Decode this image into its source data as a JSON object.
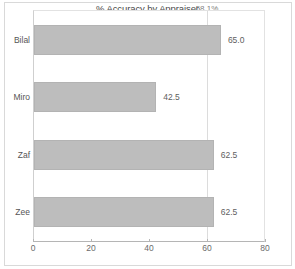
{
  "chart_data": {
    "type": "bar",
    "orientation": "horizontal",
    "title": "% Accuracy by Appraiser",
    "xlabel": "",
    "ylabel": "",
    "categories": [
      "Bilal",
      "Miro",
      "Zaf",
      "Zee"
    ],
    "values": [
      65.0,
      42.5,
      62.5,
      62.5
    ],
    "value_labels": [
      "65.0",
      "42.5",
      "62.5",
      "62.5"
    ],
    "xlim": [
      0,
      80
    ],
    "xticks": [
      0,
      20,
      40,
      60,
      80
    ],
    "xtick_labels": [
      "0",
      "20",
      "40",
      "60",
      "80"
    ],
    "grid": true,
    "gridlines_x": [
      60
    ],
    "legend": null,
    "annotations": [
      {
        "text": "58.1%",
        "x": 60,
        "position": "top",
        "role": "reference-line-label"
      }
    ],
    "colors": {
      "bar_fill": "#bdbdbd",
      "bar_edge": "#b3b3b3",
      "gridline": "#dcdcdc",
      "axis": "#b5b5b5",
      "title_text": "#4a4a4a",
      "label_text": "#606060",
      "background": "#ffffff"
    }
  }
}
